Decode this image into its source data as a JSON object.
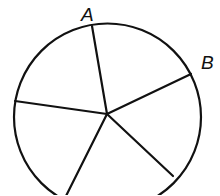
{
  "diagram": {
    "type": "circle-divided-into-sectors",
    "sector_count": 5,
    "labels": {
      "a": "A",
      "b": "B"
    },
    "stroke_color": "#111111",
    "background": "#ffffff"
  }
}
